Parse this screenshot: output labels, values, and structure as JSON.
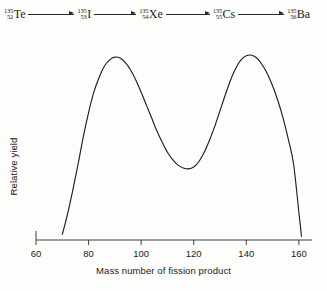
{
  "decay_chain": {
    "arrow_icon": "right-arrow-icon",
    "nuclides": [
      {
        "mass": "135",
        "atomic": "52",
        "symbol": "Te"
      },
      {
        "mass": "135",
        "atomic": "53",
        "symbol": "I"
      },
      {
        "mass": "135",
        "atomic": "54",
        "symbol": "Xe"
      },
      {
        "mass": "135",
        "atomic": "55",
        "symbol": "Cs"
      },
      {
        "mass": "135",
        "atomic": "56",
        "symbol": "Ba"
      }
    ]
  },
  "chart_data": {
    "type": "line",
    "title": "",
    "xlabel": "Mass number of fission product",
    "ylabel": "Relative yield",
    "xlim": [
      60,
      165
    ],
    "ylim": [
      0,
      1.05
    ],
    "grid": false,
    "legend": null,
    "xticks": [
      60,
      80,
      100,
      120,
      140,
      160
    ],
    "xtick_labels": [
      "60",
      "80",
      "100",
      "120",
      "140",
      "160"
    ],
    "yticks": [],
    "ytick_labels": [],
    "line_color": "#1f1f1f",
    "series": [
      {
        "name": "Fission yield",
        "x": [
          70,
          72,
          74,
          76,
          78,
          80,
          82,
          84,
          86,
          88,
          90,
          92,
          94,
          96,
          98,
          100,
          102,
          104,
          106,
          108,
          110,
          112,
          114,
          116,
          118,
          120,
          122,
          124,
          126,
          128,
          130,
          132,
          134,
          136,
          138,
          140,
          142,
          144,
          146,
          148,
          150,
          152,
          154,
          156,
          158,
          160,
          161
        ],
        "y": [
          0.03,
          0.14,
          0.27,
          0.41,
          0.56,
          0.69,
          0.8,
          0.88,
          0.94,
          0.975,
          0.99,
          0.985,
          0.96,
          0.92,
          0.865,
          0.8,
          0.73,
          0.66,
          0.59,
          0.53,
          0.475,
          0.435,
          0.405,
          0.39,
          0.385,
          0.395,
          0.425,
          0.475,
          0.54,
          0.615,
          0.7,
          0.785,
          0.865,
          0.93,
          0.975,
          0.997,
          1.0,
          0.985,
          0.95,
          0.9,
          0.835,
          0.755,
          0.66,
          0.545,
          0.41,
          0.15,
          0.02
        ]
      }
    ],
    "annotations": {
      "peak_left_mass": 90,
      "peak_right_mass": 142,
      "valley_mass": 118
    }
  }
}
